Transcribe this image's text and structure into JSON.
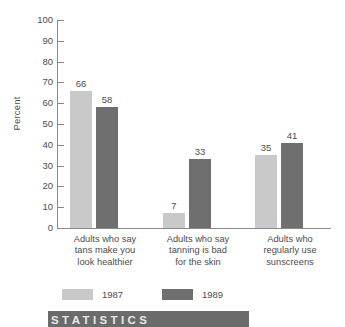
{
  "chart_data": {
    "type": "bar",
    "title": "",
    "subtitle": "",
    "xlabel": "",
    "ylabel": "Percent",
    "ylim": [
      0,
      100
    ],
    "ytick_step": 10,
    "yticks": [
      "100",
      "90",
      "80",
      "70",
      "60",
      "50",
      "40",
      "30",
      "20",
      "10",
      "0"
    ],
    "grid": false,
    "legend_position": "bottom",
    "categories": [
      "Adults who say tans make you look healthier",
      "Adults who say tanning is bad for the skin",
      "Adults who regularly use sunscreens"
    ],
    "category_lines": [
      [
        "Adults who say",
        "tans make you",
        "look healthier"
      ],
      [
        "Adults who say",
        "tanning is bad",
        "for the skin"
      ],
      [
        "Adults who",
        "regularly use",
        "sunscreens"
      ]
    ],
    "series": [
      {
        "name": "1987",
        "color": "#c9c9c9",
        "values": [
          66,
          7,
          35
        ]
      },
      {
        "name": "1989",
        "color": "#6f6f6f",
        "values": [
          58,
          33,
          41
        ]
      }
    ],
    "data_labels": [
      "66",
      "58",
      "7",
      "33",
      "35",
      "41"
    ]
  },
  "legend": {
    "items": [
      {
        "label": "1987",
        "swatch": "light"
      },
      {
        "label": "1989",
        "swatch": "dark"
      }
    ]
  },
  "banner": {
    "text": "STATISTICS"
  },
  "colors": {
    "series_1987": "#c9c9c9",
    "series_1989": "#6f6f6f",
    "axis": "#8a8a8a",
    "text": "#4d4d4d",
    "banner_bg": "#6b6b6b"
  }
}
